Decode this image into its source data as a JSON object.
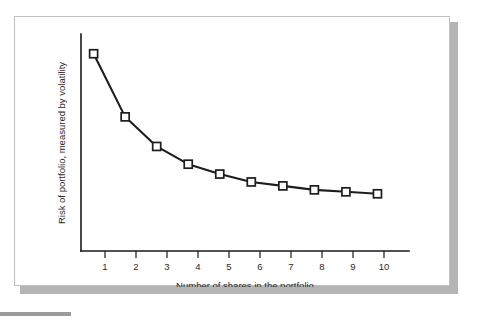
{
  "figure": {
    "frame_border_color": "#c0c0c0",
    "shadow_color": "#b4b4b4",
    "background_color": "#ffffff",
    "rule_color": "#9a9a9a"
  },
  "chart_data": {
    "type": "line",
    "title": "",
    "xlabel": "Number of shares in the portfolio",
    "ylabel": "Risk of portfolio, measured by volatility",
    "categories": [
      "1",
      "2",
      "3",
      "4",
      "5",
      "6",
      "7",
      "8",
      "9",
      "10"
    ],
    "x": [
      1,
      2,
      3,
      4,
      5,
      6,
      7,
      8,
      9,
      10
    ],
    "series": [
      {
        "name": "Portfolio risk",
        "values": [
          100,
          68,
          53,
          44,
          39,
          35,
          33,
          31,
          30,
          29
        ],
        "marker": "open-square",
        "marker_fill": "#ffffff",
        "line_color": "#1d1d1d"
      }
    ],
    "xlim": [
      0.6,
      11.0
    ],
    "ylim": [
      0,
      110
    ],
    "xticks": [
      1,
      2,
      3,
      4,
      5,
      6,
      7,
      8,
      9,
      10
    ],
    "xtick_labels": [
      "1",
      "2",
      "3",
      "4",
      "5",
      "6",
      "7",
      "8",
      "9",
      "10"
    ],
    "yticks": [],
    "ytick_labels": [],
    "grid": false,
    "legend": false,
    "legend_position": "none",
    "y_axis_values_shown": false
  }
}
